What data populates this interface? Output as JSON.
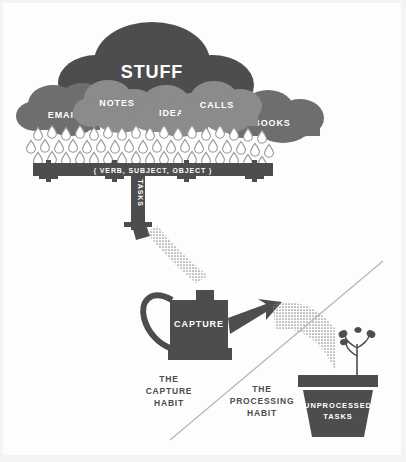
{
  "poster": {
    "title": "Capture and Processing Habits",
    "background_color": "#f4f4f4",
    "canvas_color": "#fdfdfd"
  },
  "palette": {
    "dark_gray": "#4d4d4d",
    "mid_gray": "#6e6e6e",
    "light_gray": "#8b8b8b",
    "outline_gray": "#9a9a9a",
    "white": "#ffffff",
    "divider": "#b5b5b5"
  },
  "cloud_main": {
    "label": "STUFF",
    "color": "#4d4d4d"
  },
  "clouds": [
    {
      "label": "EMAIL",
      "color": "#6e6e6e"
    },
    {
      "label": "NOTES",
      "color": "#8b8b8b"
    },
    {
      "label": "IDEAS",
      "color": "#8b8b8b"
    },
    {
      "label": "CALLS",
      "color": "#8b8b8b"
    },
    {
      "label": "BOOKS",
      "color": "#6e6e6e"
    }
  ],
  "rain": {
    "icon": "raindrop-icon",
    "rows": 3,
    "per_row": 17,
    "fill": "#ffffff",
    "stroke": "#9a9a9a"
  },
  "gutter": {
    "label": "( VERB, SUBJECT, OBJECT )",
    "color": "#4d4d4d"
  },
  "downspout": {
    "label": "TASKS",
    "color": "#4d4d4d"
  },
  "watering_can": {
    "label": "CAPTURE",
    "color": "#4d4d4d"
  },
  "pot": {
    "label_line1": "UNPROCESSED",
    "label_line2": "TASKS",
    "color": "#4d4d4d",
    "rim_color": "#4d4d4d",
    "plant_icon": "sprout-icon"
  },
  "captions": {
    "capture": [
      "THE",
      "CAPTURE",
      "HABIT"
    ],
    "processing": [
      "THE",
      "PROCESSING",
      "HABIT"
    ]
  },
  "divider": {
    "name": "diagonal-divider",
    "color": "#b5b5b5"
  }
}
